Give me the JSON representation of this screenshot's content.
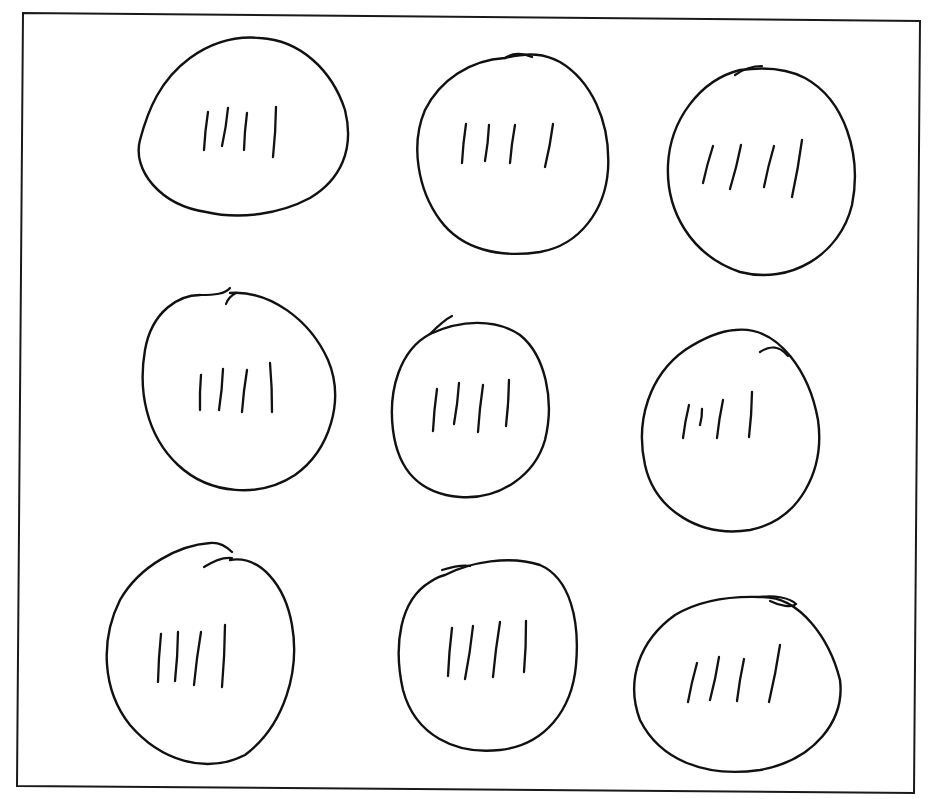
{
  "figure": {
    "type": "hand-drawn illustration",
    "rows": 3,
    "columns": 3,
    "tally_marks_per_group": 4,
    "total_groups": 9,
    "total_marks": 36,
    "colors": {
      "background": "#ffffff",
      "ink": "#111111"
    }
  },
  "frame": {
    "top_left": [
      23,
      13
    ],
    "top_right": [
      920,
      21
    ],
    "bottom_right": [
      914,
      793
    ],
    "bottom_left": [
      17,
      786
    ]
  },
  "groups": [
    {
      "row": 1,
      "col": 1,
      "tally_count": 4,
      "outline": "M 206 212 C 160 205 132 170 140 140 C 148 110 160 80 190 58 C 215 40 238 36 260 38 C 300 40 332 70 345 110 C 355 150 340 180 310 198 C 280 214 240 220 206 212 Z",
      "overlap": "",
      "marks": [
        [
          208,
          112,
          204,
          150
        ],
        [
          228,
          108,
          222,
          146
        ],
        [
          247,
          113,
          244,
          150
        ],
        [
          276,
          107,
          273,
          157
        ]
      ]
    },
    {
      "row": 1,
      "col": 2,
      "tally_count": 4,
      "outline": "M 505 58 C 470 60 440 80 425 110 C 410 145 418 190 440 220 C 462 250 500 258 540 252 C 580 245 605 210 608 170 C 611 120 590 80 560 62 C 545 54 530 52 505 58 Z",
      "overlap": "M 505 58 C 512 53 520 52 532 57",
      "marks": [
        [
          466,
          124,
          462,
          163
        ],
        [
          489,
          125,
          485,
          161
        ],
        [
          515,
          125,
          510,
          163
        ],
        [
          553,
          124,
          545,
          167
        ]
      ]
    },
    {
      "row": 1,
      "col": 3,
      "tally_count": 4,
      "outline": "M 740 70 C 700 80 670 120 668 165 C 666 210 690 255 740 272 C 790 285 840 255 852 205 C 862 155 845 100 805 78 C 790 70 770 66 740 70 Z",
      "overlap": "M 735 75 C 745 68 755 66 762 66",
      "marks": [
        [
          713,
          146,
          703,
          183
        ],
        [
          741,
          145,
          730,
          189
        ],
        [
          774,
          146,
          764,
          187
        ],
        [
          802,
          140,
          792,
          197
        ]
      ]
    },
    {
      "row": 2,
      "col": 1,
      "tally_count": 4,
      "outline": "M 230 293 C 270 290 310 320 328 360 C 345 400 330 450 295 475 C 260 498 210 495 178 465 C 146 435 138 390 145 350 C 152 310 180 295 200 295",
      "overlap": "M 200 295 C 215 295 225 294 230 288 M 226 304 C 228 298 232 295 236 293",
      "marks": [
        [
          201,
          375,
          200,
          410
        ],
        [
          223,
          369,
          219,
          410
        ],
        [
          247,
          370,
          242,
          412
        ],
        [
          270,
          363,
          272,
          412
        ]
      ]
    },
    {
      "row": 2,
      "col": 2,
      "tally_count": 4,
      "outline": "M 430 334 C 460 320 495 318 520 335 C 545 355 555 400 545 440 C 535 475 500 500 460 497 C 420 494 398 470 393 430 C 388 390 400 350 430 334 Z",
      "overlap": "M 430 334 C 440 324 448 318 452 316",
      "marks": [
        [
          437,
          389,
          433,
          431
        ],
        [
          459,
          383,
          454,
          424
        ],
        [
          483,
          385,
          478,
          432
        ],
        [
          509,
          380,
          506,
          426
        ]
      ]
    },
    {
      "row": 2,
      "col": 3,
      "tally_count": 4,
      "outline": "M 735 330 C 780 325 810 375 818 420 C 825 470 800 520 750 530 C 700 538 655 510 645 465 C 635 420 650 375 685 350 C 705 337 720 331 735 330 Z",
      "overlap": "M 760 352 C 770 345 780 346 788 356",
      "marks": [
        [
          689,
          405,
          683,
          438
        ],
        [
          702,
          409,
          700,
          425
        ],
        [
          723,
          400,
          717,
          438
        ],
        [
          752,
          392,
          749,
          437
        ]
      ]
    },
    {
      "row": 3,
      "col": 1,
      "tally_count": 4,
      "outline": "M 230 560 C 260 555 285 585 292 625 C 300 670 285 725 245 755 C 205 775 160 760 130 725 C 102 690 100 640 120 600 C 140 565 180 545 210 543 C 220 542 228 548 232 552",
      "overlap": "M 204 567 C 215 560 225 557 232 558",
      "marks": [
        [
          161,
          634,
          158,
          682
        ],
        [
          178,
          632,
          175,
          681
        ],
        [
          201,
          632,
          194,
          685
        ],
        [
          225,
          625,
          222,
          687
        ]
      ]
    },
    {
      "row": 3,
      "col": 2,
      "tally_count": 4,
      "outline": "M 445 575 C 470 562 510 555 540 565 C 570 578 580 620 576 665 C 572 710 545 745 500 750 C 455 755 415 735 403 690 C 393 645 400 600 430 582 C 436 578 440 576 445 575 Z",
      "overlap": "M 442 570 C 455 566 465 565 470 566",
      "marks": [
        [
          452,
          628,
          448,
          676
        ],
        [
          473,
          626,
          465,
          679
        ],
        [
          500,
          622,
          493,
          677
        ],
        [
          526,
          621,
          524,
          672
        ]
      ]
    },
    {
      "row": 3,
      "col": 3,
      "tally_count": 4,
      "outline": "M 760 597 C 800 595 830 640 840 680 C 845 720 815 760 760 770 C 705 778 660 760 640 720 C 625 680 640 640 675 615 C 700 600 730 596 760 597 Z",
      "overlap": "M 760 597 C 775 595 790 598 796 604 C 792 608 780 606 770 601",
      "marks": [
        [
          697,
          663,
          688,
          702
        ],
        [
          719,
          657,
          710,
          700
        ],
        [
          744,
          659,
          737,
          701
        ],
        [
          780,
          645,
          769,
          702
        ]
      ]
    }
  ]
}
